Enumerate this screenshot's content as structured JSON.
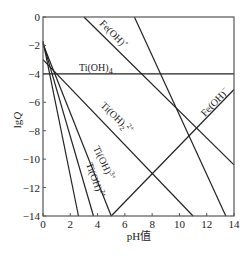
{
  "chart_data": {
    "type": "line",
    "title": "",
    "xlabel": "pH值",
    "ylabel": "lgQ",
    "xlim": [
      0,
      14
    ],
    "ylim": [
      -14,
      0
    ],
    "xticks": [
      "0",
      "2",
      "4",
      "6",
      "8",
      "10",
      "12",
      "14"
    ],
    "yticks": [
      "0",
      "-2",
      "-4",
      "-6",
      "-8",
      "-10",
      "-12",
      "-14"
    ],
    "grid": false,
    "legend": "inline labels",
    "series": [
      {
        "name": "Ti(OH)4",
        "label_main": "Ti(OH)",
        "label_sub": "4",
        "label_sup": "",
        "points": [
          [
            0,
            -4
          ],
          [
            14,
            -4
          ]
        ]
      },
      {
        "name": "Ti(OH)2 2+",
        "label_main": "Ti(OH)",
        "label_sub": "2",
        "label_sup": "2+",
        "points": [
          [
            0,
            -3.0
          ],
          [
            11.0,
            -14
          ]
        ]
      },
      {
        "name": "Ti(OH)3+",
        "label_main": "Ti(OH)",
        "label_sub": "",
        "label_sup": "3+",
        "points": [
          [
            0,
            -1.9
          ],
          [
            5.0,
            -14
          ]
        ]
      },
      {
        "name": "Ti(OH)2+",
        "label_main": "Ti(OH)",
        "label_sub": "",
        "label_sup": "2+",
        "points": [
          [
            0,
            -1.8
          ],
          [
            3.7,
            -14
          ]
        ]
      },
      {
        "name": "Ti line 4",
        "label_main": "",
        "label_sub": "",
        "label_sup": "",
        "points": [
          [
            0,
            -1.7
          ],
          [
            2.6,
            -14
          ]
        ]
      },
      {
        "name": "Fe(OH)+",
        "label_main": "Fe(OH)",
        "label_sub": "",
        "label_sup": "+",
        "points": [
          [
            3.0,
            0
          ],
          [
            14,
            -10.4
          ]
        ]
      },
      {
        "name": "Fe steep",
        "label_main": "",
        "label_sub": "",
        "label_sup": "",
        "points": [
          [
            6.7,
            0
          ],
          [
            13.4,
            -14
          ]
        ]
      },
      {
        "name": "Fe(OH)-",
        "label_main": "Fe(OH)",
        "label_sub": "",
        "label_sup": "−",
        "points": [
          [
            5.0,
            -14
          ],
          [
            14,
            -5.1
          ]
        ]
      }
    ]
  }
}
